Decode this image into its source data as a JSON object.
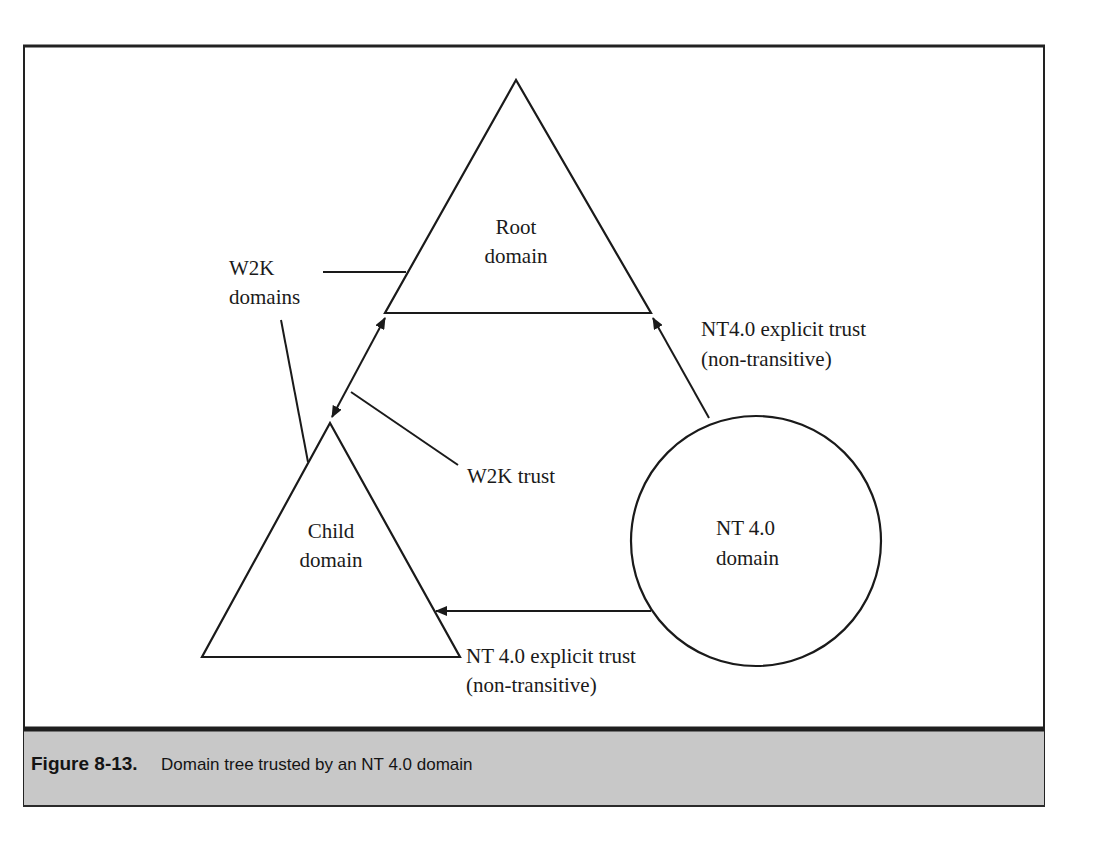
{
  "figure": {
    "number_label": "Figure 8-13.",
    "caption": "Domain tree trusted by an NT 4.0 domain",
    "colors": {
      "background": "#ffffff",
      "stroke": "#1a1a1a",
      "caption_bar": "#c8c8c8",
      "frame": "#222222"
    }
  },
  "nodes": {
    "root_domain": {
      "line1": "Root",
      "line2": "domain",
      "shape": "triangle"
    },
    "child_domain": {
      "line1": "Child",
      "line2": "domain",
      "shape": "triangle"
    },
    "nt4_domain": {
      "line1": "NT 4.0",
      "line2": "domain",
      "shape": "circle"
    }
  },
  "labels": {
    "w2k_domains": {
      "line1": "W2K",
      "line2": "domains"
    },
    "w2k_trust": "W2K trust",
    "nt4_explicit_trust_upper": {
      "line1": "NT4.0 explicit trust",
      "line2": "(non-transitive)"
    },
    "nt4_explicit_trust_lower": {
      "line1": "NT 4.0 explicit trust",
      "line2": "(non-transitive)"
    }
  },
  "edges": [
    {
      "from": "child_domain",
      "to": "root_domain",
      "type": "bidirectional",
      "label": "W2K trust"
    },
    {
      "from": "nt4_domain",
      "to": "root_domain",
      "type": "one-way",
      "label": "NT4.0 explicit trust (non-transitive)"
    },
    {
      "from": "nt4_domain",
      "to": "child_domain",
      "type": "one-way",
      "label": "NT 4.0 explicit trust (non-transitive)"
    }
  ]
}
